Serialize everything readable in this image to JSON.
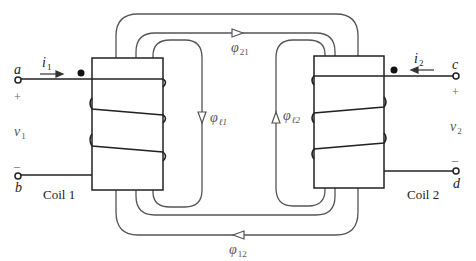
{
  "diagram": {
    "type": "magnetically coupled coils",
    "coil1": {
      "label": "Coil 1",
      "terminal_top": "a",
      "terminal_bottom": "b",
      "current": {
        "symbol": "i",
        "sub": "1"
      },
      "voltage": {
        "symbol": "v",
        "sub": "1"
      },
      "plus": "+",
      "minus": "–"
    },
    "coil2": {
      "label": "Coil 2",
      "terminal_top": "c",
      "terminal_bottom": "d",
      "current": {
        "symbol": "i",
        "sub": "2"
      },
      "voltage": {
        "symbol": "v",
        "sub": "2"
      },
      "plus": "+",
      "minus": "–"
    },
    "fluxes": {
      "phi21": {
        "symbol": "φ",
        "sub": "21"
      },
      "phi12": {
        "symbol": "φ",
        "sub": "12"
      },
      "phil1": {
        "symbol": "φ",
        "sub": "ℓ1"
      },
      "phil2": {
        "symbol": "φ",
        "sub": "ℓ2"
      }
    },
    "colors": {
      "line": "#333333",
      "flux_line": "#555555",
      "dot": "#111111"
    }
  }
}
